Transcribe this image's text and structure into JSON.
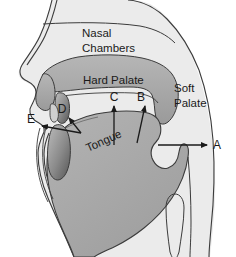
{
  "diagram": {
    "type": "anatomical-cross-section",
    "canvas": {
      "width": 236,
      "height": 257
    },
    "labels": {
      "nasal_line1": "Nasal",
      "nasal_line2": "Chambers",
      "hard_palate": "Hard Palate",
      "soft_palate_line1": "Soft",
      "soft_palate_line2": "Palate",
      "tongue": "Tongue"
    },
    "points": {
      "a": "A",
      "b": "B",
      "c": "C",
      "d": "D",
      "e": "E"
    },
    "colors": {
      "head_fill": "#ebebeb",
      "outline": "#3b3b3b",
      "tissue_fill": "#a9a9a9",
      "tissue_fill_light": "#b9b9b9",
      "dark_tissue": "#6e6e6e",
      "text": "#1a1a1a",
      "background": "#ffffff"
    }
  }
}
